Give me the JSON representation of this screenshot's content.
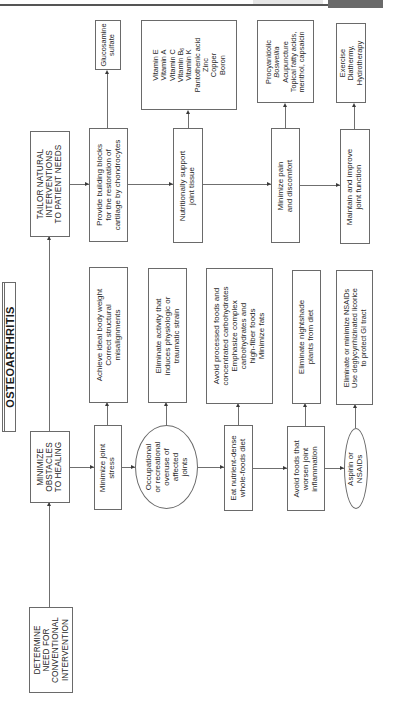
{
  "header": {
    "bar_color": "#555555",
    "tab_color": "#6a6a6a"
  },
  "title": {
    "label": "OSTEOARTHRITIS"
  },
  "level1": {
    "tailor": [
      "TAILOR NATURAL",
      "INTERVENTIONS",
      "TO PATIENT NEEDS"
    ],
    "minimize": [
      "MINIMIZE",
      "OBSTACLES",
      "TO HEALING"
    ],
    "determine": [
      "DETERMINE",
      "NEED FOR",
      "CONVENTIONAL",
      "INTERVENTION"
    ]
  },
  "tailor_branch": {
    "goals": [
      {
        "lines": [
          "Provide building blocks",
          "for the restoration of",
          "cartilage by chondrocytes"
        ]
      },
      {
        "lines": [
          "Nutritionally support",
          "joint tissue"
        ]
      },
      {
        "lines": [
          "Minimize pain",
          "and discomfort"
        ]
      },
      {
        "lines": [
          "Maintain and improve",
          "joint function"
        ]
      }
    ],
    "interventions": [
      {
        "lines": [
          "Glucosamine",
          "sulfate"
        ]
      },
      {
        "lines": [
          "Vitamin E",
          "Vitamin A",
          "Vitamin C",
          "Vitamin B",
          "Vitamin K",
          "Pantothenic acid",
          "Zinc",
          "Copper",
          "Boron"
        ],
        "subscript_line_4": "6"
      },
      {
        "lines": [
          "Procyanidolic",
          "Boswellia",
          "Acupuncture",
          "Topical fatty acids,",
          "menthol, capsaicin"
        ],
        "italic_line": 2
      },
      {
        "lines": [
          "Exercise",
          "Diathermy,",
          "Hydrotherapy"
        ]
      }
    ]
  },
  "obstacle_branch": {
    "obstacles": [
      {
        "shape": "box",
        "lines": [
          "Minimize joint",
          "stress"
        ]
      },
      {
        "shape": "ellipse",
        "lines": [
          "Occupational",
          "or recreational",
          "overuse of",
          "affected",
          "joints"
        ]
      },
      {
        "shape": "box",
        "lines": [
          "Eat nutrient-dense",
          "whole-foods diet"
        ]
      },
      {
        "shape": "box",
        "lines": [
          "Avoid foods that",
          "worsen joint",
          "inflammation"
        ]
      },
      {
        "shape": "ellipse",
        "lines": [
          "Aspirin or",
          "NSAIDs"
        ]
      }
    ],
    "actions": [
      {
        "lines": [
          "Achieve ideal body weight",
          "Correct structural",
          "misalignments"
        ]
      },
      {
        "lines": [
          "Eliminate activity that",
          "induces physiologic or",
          "traumatic strain"
        ]
      },
      {
        "lines": [
          "Avoid processed foods and",
          "concentrated carbohydrates",
          "Emphasize complex",
          "carbohydrates and",
          "high-fiber foods",
          "Minimize fats"
        ]
      },
      {
        "lines": [
          "Eliminate nightshade",
          "plants from diet"
        ]
      },
      {
        "lines": [
          "Eliminate or minimize NSAIDs",
          "Use deglycyrrhizinated licorice",
          "to protect GI tract"
        ]
      }
    ]
  }
}
